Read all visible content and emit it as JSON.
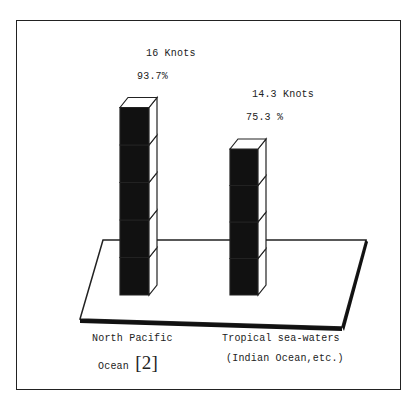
{
  "chart_data": {
    "type": "bar",
    "style": "3d-stacked-cubes",
    "title": "",
    "categories": [
      "North Pacific Ocean [2]",
      "Tropical sea-waters (Indian Ocean,etc.)"
    ],
    "series": [
      {
        "name": "Speed (Knots)",
        "values": [
          16,
          14.3
        ]
      },
      {
        "name": "Percentage",
        "values": [
          93.7,
          75.3
        ]
      }
    ],
    "cube_counts": [
      5,
      4
    ],
    "xlabel": "",
    "ylabel": "",
    "grid": false,
    "legend": "none"
  },
  "bars": [
    {
      "speed_label": "16 Knots",
      "percent_label": "93.7%",
      "category_line1": "North Pacific",
      "category_line2": "Ocean",
      "reference": "[2]"
    },
    {
      "speed_label": "14.3 Knots",
      "percent_label": "75.3 %",
      "category_line1": "Tropical sea-waters",
      "category_line2": "(Indian Ocean,etc.)",
      "reference": ""
    }
  ],
  "colors": {
    "cube_front": "#111111",
    "outline": "#222222",
    "background": "#ffffff"
  }
}
